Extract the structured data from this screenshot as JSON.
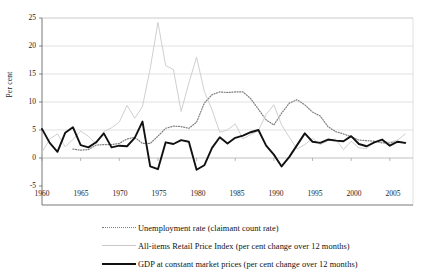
{
  "chart_data": {
    "type": "line",
    "title": "",
    "xlabel": "",
    "ylabel": "Per cent",
    "xlim": [
      1960,
      2008
    ],
    "ylim": [
      -5,
      25
    ],
    "yticks": [
      -5,
      0,
      5,
      10,
      15,
      20,
      25
    ],
    "xticks": [
      1960,
      1965,
      1970,
      1975,
      1980,
      1985,
      1990,
      1995,
      2000,
      2005
    ],
    "grid": "horizontal",
    "legend_position": "below",
    "series": [
      {
        "name": "Unemployment rate (claimant count rate)",
        "style": "dotted",
        "color": "#7d7d7d",
        "x": [
          1964,
          1965,
          1966,
          1967,
          1968,
          1969,
          1970,
          1971,
          1972,
          1973,
          1974,
          1975,
          1976,
          1977,
          1978,
          1979,
          1980,
          1981,
          1982,
          1983,
          1984,
          1985,
          1986,
          1987,
          1988,
          1989,
          1990,
          1991,
          1992,
          1993,
          1994,
          1995,
          1996,
          1997,
          1998,
          1999,
          2000,
          2001,
          2002,
          2003,
          2004,
          2005,
          2006,
          2007
        ],
        "values": [
          1.6,
          1.4,
          1.5,
          2.3,
          2.4,
          2.4,
          2.6,
          3.4,
          3.7,
          2.6,
          2.6,
          3.9,
          5.3,
          5.7,
          5.6,
          5.3,
          6.4,
          9.8,
          11.3,
          11.8,
          11.7,
          11.8,
          11.8,
          10.6,
          8.7,
          6.8,
          5.9,
          8.0,
          9.8,
          10.4,
          9.5,
          8.2,
          7.5,
          5.6,
          4.7,
          4.3,
          3.8,
          3.2,
          3.1,
          3.0,
          2.7,
          2.7,
          3.0,
          2.6
        ]
      },
      {
        "name": "All-items Retail Price Index (per cent change over 12 months)",
        "style": "thin-solid",
        "color": "#c9c9c9",
        "x": [
          1960,
          1961,
          1962,
          1963,
          1964,
          1965,
          1966,
          1967,
          1968,
          1969,
          1970,
          1971,
          1972,
          1973,
          1974,
          1975,
          1976,
          1977,
          1978,
          1979,
          1980,
          1981,
          1982,
          1983,
          1984,
          1985,
          1986,
          1987,
          1988,
          1989,
          1990,
          1991,
          1992,
          1993,
          1994,
          1995,
          1996,
          1997,
          1998,
          1999,
          2000,
          2001,
          2002,
          2003,
          2004,
          2005,
          2006,
          2007
        ],
        "values": [
          1.0,
          3.4,
          4.3,
          2.0,
          3.3,
          4.8,
          3.9,
          2.5,
          4.7,
          5.4,
          6.4,
          9.4,
          7.1,
          9.2,
          16.0,
          24.2,
          16.5,
          15.8,
          8.3,
          13.4,
          18.0,
          11.9,
          8.6,
          4.6,
          5.0,
          6.1,
          3.4,
          4.2,
          4.9,
          7.8,
          9.5,
          5.9,
          3.7,
          1.6,
          2.4,
          3.5,
          2.4,
          3.1,
          3.4,
          1.5,
          3.0,
          1.8,
          1.7,
          2.9,
          3.0,
          2.8,
          3.2,
          4.3
        ]
      },
      {
        "name": "GDP at constant market prices (per cent change over 12 months)",
        "style": "thick-solid",
        "color": "#111111",
        "x": [
          1960,
          1961,
          1962,
          1963,
          1964,
          1965,
          1966,
          1967,
          1968,
          1969,
          1970,
          1971,
          1972,
          1973,
          1974,
          1975,
          1976,
          1977,
          1978,
          1979,
          1980,
          1981,
          1982,
          1983,
          1984,
          1985,
          1986,
          1987,
          1988,
          1989,
          1990,
          1991,
          1992,
          1993,
          1994,
          1995,
          1996,
          1997,
          1998,
          1999,
          2000,
          2001,
          2002,
          2003,
          2004,
          2005,
          2006,
          2007
        ],
        "values": [
          5.2,
          2.7,
          1.1,
          4.5,
          5.5,
          2.3,
          1.9,
          2.8,
          4.4,
          1.9,
          2.2,
          2.1,
          3.6,
          6.5,
          -1.5,
          -2.0,
          2.8,
          2.5,
          3.2,
          2.9,
          -2.1,
          -1.3,
          1.8,
          3.7,
          2.6,
          3.6,
          4.0,
          4.6,
          5.0,
          2.2,
          0.6,
          -1.5,
          0.2,
          2.3,
          4.4,
          2.9,
          2.7,
          3.3,
          3.1,
          3.0,
          3.9,
          2.5,
          2.1,
          2.8,
          3.3,
          2.2,
          2.9,
          2.7
        ]
      }
    ]
  },
  "axis": {
    "ylabel": "Per cent",
    "yticks": [
      "25",
      "20",
      "15",
      "10",
      "5",
      "0",
      "-5"
    ],
    "xticks": [
      "1960",
      "1965",
      "1970",
      "1975",
      "1980",
      "1985",
      "1990",
      "1995",
      "2000",
      "2005"
    ]
  },
  "legend": {
    "items": [
      {
        "label": "Unemployment rate (claimant count rate)",
        "style": "dotted"
      },
      {
        "label": "All-items Retail Price Index (per cent change over 12 months)",
        "style": "thin-solid"
      },
      {
        "label": "GDP at constant market prices (per cent change over 12 months)",
        "style": "thick-solid"
      }
    ]
  }
}
